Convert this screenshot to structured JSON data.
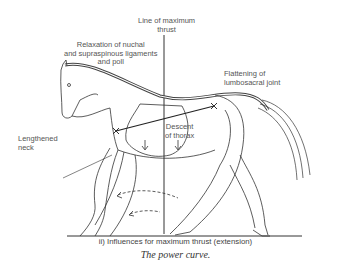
{
  "figure": {
    "labels": {
      "line_of_max_thrust": [
        "Line of maximum",
        "thrust"
      ],
      "relaxation": [
        "Relaxation of nuchal",
        "and supraspinous ligaments",
        "and poll"
      ],
      "flattening": [
        "Flattening of",
        "lumbosacral joint"
      ],
      "descent": [
        "Descent",
        "of thorax"
      ],
      "lengthened": [
        "Lengthened",
        "neck"
      ]
    },
    "subcaption": "ii) Influences for maximum thrust (extension)",
    "caption": "The power curve."
  }
}
